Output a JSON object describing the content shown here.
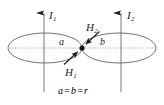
{
  "figure": {
    "background_color": "#ffffff",
    "stroke_color": "#555555",
    "text_color": "#1a1a1a",
    "width": 164,
    "height": 105
  },
  "labels": {
    "current_left": {
      "symbol": "I",
      "subscript": "1",
      "text": "I"
    },
    "current_right": {
      "symbol": "I",
      "subscript": "2",
      "text": "I"
    },
    "field_upper": {
      "symbol": "H",
      "subscript": "2",
      "text": "H"
    },
    "field_lower": {
      "symbol": "H",
      "subscript": "1",
      "text": "H"
    },
    "radius_left": "a",
    "radius_right": "b"
  },
  "caption": {
    "left_term": "a",
    "operator_1": "=",
    "middle_term": "b",
    "operator_2": "=",
    "right_term": "r",
    "full_text": "a = b = r"
  },
  "geometry": {
    "tangent_point": {
      "x": 82,
      "y": 48
    },
    "left_loop": {
      "cx": 45,
      "cy": 48,
      "rx": 37,
      "ry": 15
    },
    "right_loop": {
      "cx": 119,
      "cy": 48,
      "rx": 37,
      "ry": 15
    },
    "left_wire_x": 44,
    "right_wire_x": 121,
    "wire_top_y": 5,
    "wire_bottom_y": 92,
    "axis_line_y": 48,
    "axis_start_x": 10,
    "axis_end_x": 155
  }
}
